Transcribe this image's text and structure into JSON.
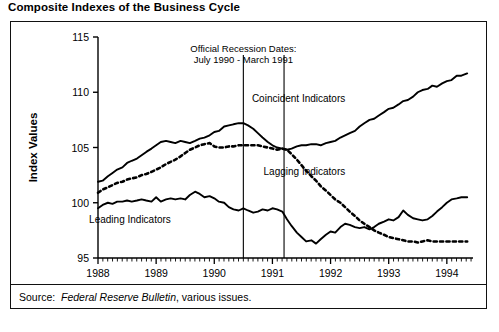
{
  "title": "Composite Indexes of the Business Cycle",
  "source": {
    "label": "Source:",
    "publication": "Federal Reserve Bulletin",
    "suffix": ", various issues."
  },
  "chart_data": {
    "type": "line",
    "title": "Composite Indexes of the Business Cycle",
    "xlabel": "Years",
    "ylabel": "Index Values",
    "xlim": [
      1988,
      1994.45
    ],
    "ylim": [
      95,
      115
    ],
    "yticks": [
      95,
      100,
      105,
      110,
      115
    ],
    "xticks": [
      1988,
      1989,
      1990,
      1991,
      1992,
      1993,
      1994
    ],
    "grid": false,
    "legend_position": "inline-annotations",
    "annotations": [
      {
        "name": "recession-dates",
        "line1": "Official Recession Dates:",
        "line2": "July 1990 - March 1991",
        "x": 1990.5,
        "y": 113.6
      }
    ],
    "vlines": [
      {
        "name": "recession-start",
        "x": 1990.5,
        "label": "July 1990"
      },
      {
        "name": "recession-end",
        "x": 1991.2,
        "label": "March 1991"
      }
    ],
    "series": [
      {
        "name": "Coincident Indicators",
        "style": "solid",
        "color": "#000000",
        "label_x": 1991.45,
        "label_y": 109.1,
        "x": [
          1988.0,
          1988.08,
          1988.17,
          1988.25,
          1988.33,
          1988.42,
          1988.5,
          1988.58,
          1988.67,
          1988.75,
          1988.83,
          1988.92,
          1989.0,
          1989.08,
          1989.17,
          1989.25,
          1989.33,
          1989.42,
          1989.5,
          1989.58,
          1989.67,
          1989.75,
          1989.83,
          1989.92,
          1990.0,
          1990.08,
          1990.17,
          1990.25,
          1990.33,
          1990.42,
          1990.5,
          1990.58,
          1990.67,
          1990.75,
          1990.83,
          1990.92,
          1991.0,
          1991.08,
          1991.17,
          1991.25,
          1991.33,
          1991.42,
          1991.5,
          1991.58,
          1991.67,
          1991.75,
          1991.83,
          1991.92,
          1992.0,
          1992.08,
          1992.17,
          1992.25,
          1992.33,
          1992.42,
          1992.5,
          1992.58,
          1992.67,
          1992.75,
          1992.83,
          1992.92,
          1993.0,
          1993.08,
          1993.17,
          1993.25,
          1993.33,
          1993.42,
          1993.5,
          1993.58,
          1993.67,
          1993.75,
          1993.83,
          1993.92,
          1994.0,
          1994.08,
          1994.17,
          1994.25,
          1994.35
        ],
        "values": [
          101.9,
          102.0,
          102.4,
          102.7,
          103.0,
          103.2,
          103.6,
          103.8,
          104.0,
          104.3,
          104.6,
          104.9,
          105.2,
          105.5,
          105.6,
          105.5,
          105.4,
          105.6,
          105.5,
          105.4,
          105.6,
          105.8,
          105.9,
          106.1,
          106.4,
          106.5,
          106.9,
          107.0,
          107.1,
          107.2,
          107.2,
          107.0,
          106.7,
          106.3,
          105.9,
          105.5,
          105.2,
          105.0,
          104.9,
          104.8,
          104.9,
          105.1,
          105.2,
          105.2,
          105.3,
          105.3,
          105.2,
          105.4,
          105.5,
          105.6,
          105.9,
          106.1,
          106.3,
          106.5,
          106.9,
          107.2,
          107.5,
          107.6,
          107.9,
          108.2,
          108.5,
          108.6,
          108.9,
          109.2,
          109.3,
          109.6,
          110.0,
          110.2,
          110.3,
          110.6,
          110.5,
          110.8,
          111.0,
          111.1,
          111.5,
          111.5,
          111.7
        ]
      },
      {
        "name": "Lagging Indicators",
        "style": "dashed",
        "color": "#000000",
        "label_x": 1991.55,
        "label_y": 102.5,
        "x": [
          1988.0,
          1988.08,
          1988.17,
          1988.25,
          1988.33,
          1988.42,
          1988.5,
          1988.58,
          1988.67,
          1988.75,
          1988.83,
          1988.92,
          1989.0,
          1989.08,
          1989.17,
          1989.25,
          1989.33,
          1989.42,
          1989.5,
          1989.58,
          1989.67,
          1989.75,
          1989.83,
          1989.92,
          1990.0,
          1990.08,
          1990.17,
          1990.25,
          1990.33,
          1990.42,
          1990.5,
          1990.58,
          1990.67,
          1990.75,
          1990.83,
          1990.92,
          1991.0,
          1991.08,
          1991.17,
          1991.25,
          1991.33,
          1991.42,
          1991.5,
          1991.58,
          1991.67,
          1991.75,
          1991.83,
          1991.92,
          1992.0,
          1992.08,
          1992.17,
          1992.25,
          1992.33,
          1992.42,
          1992.5,
          1992.58,
          1992.67,
          1992.75,
          1992.83,
          1992.92,
          1993.0,
          1993.08,
          1993.17,
          1993.25,
          1993.33,
          1993.42,
          1993.5,
          1993.58,
          1993.67,
          1993.75,
          1993.83,
          1993.92,
          1994.0,
          1994.08,
          1994.17,
          1994.25,
          1994.35
        ],
        "values": [
          100.9,
          101.2,
          101.4,
          101.6,
          101.8,
          101.9,
          102.1,
          102.2,
          102.3,
          102.5,
          102.6,
          102.8,
          103.0,
          103.2,
          103.5,
          103.7,
          103.9,
          104.2,
          104.5,
          104.8,
          105.0,
          105.2,
          105.3,
          105.4,
          105.1,
          105.0,
          105.0,
          105.1,
          105.1,
          105.2,
          105.2,
          105.2,
          105.2,
          105.2,
          105.1,
          105.0,
          104.9,
          104.8,
          104.9,
          104.8,
          104.4,
          103.9,
          103.4,
          102.9,
          102.4,
          102.0,
          101.5,
          101.1,
          100.7,
          100.3,
          100.0,
          99.6,
          99.2,
          98.8,
          98.4,
          98.1,
          97.8,
          97.5,
          97.3,
          97.1,
          96.9,
          96.8,
          96.7,
          96.6,
          96.5,
          96.5,
          96.4,
          96.5,
          96.6,
          96.5,
          96.5,
          96.5,
          96.5,
          96.5,
          96.5,
          96.5,
          96.5
        ]
      },
      {
        "name": "Leading Indicators",
        "style": "solid",
        "color": "#000000",
        "label_x": 1988.55,
        "label_y": 98.2,
        "x": [
          1988.0,
          1988.08,
          1988.17,
          1988.25,
          1988.33,
          1988.42,
          1988.5,
          1988.58,
          1988.67,
          1988.75,
          1988.83,
          1988.92,
          1989.0,
          1989.08,
          1989.17,
          1989.25,
          1989.33,
          1989.42,
          1989.5,
          1989.58,
          1989.67,
          1989.75,
          1989.83,
          1989.92,
          1990.0,
          1990.08,
          1990.17,
          1990.25,
          1990.33,
          1990.42,
          1990.5,
          1990.58,
          1990.67,
          1990.75,
          1990.83,
          1990.92,
          1991.0,
          1991.08,
          1991.17,
          1991.25,
          1991.33,
          1991.42,
          1991.5,
          1991.58,
          1991.67,
          1991.75,
          1991.83,
          1991.92,
          1992.0,
          1992.08,
          1992.17,
          1992.25,
          1992.33,
          1992.42,
          1992.5,
          1992.58,
          1992.67,
          1992.75,
          1992.83,
          1992.92,
          1993.0,
          1993.08,
          1993.17,
          1993.25,
          1993.33,
          1993.42,
          1993.5,
          1993.58,
          1993.67,
          1993.75,
          1993.83,
          1993.92,
          1994.0,
          1994.08,
          1994.17,
          1994.25,
          1994.35
        ],
        "values": [
          99.5,
          99.8,
          100.0,
          99.9,
          100.1,
          100.1,
          100.2,
          100.1,
          100.2,
          100.3,
          100.2,
          100.1,
          100.5,
          100.1,
          100.3,
          100.4,
          100.3,
          100.4,
          100.3,
          100.7,
          101.0,
          100.8,
          100.5,
          100.6,
          100.4,
          100.1,
          100.0,
          99.6,
          99.4,
          99.3,
          99.5,
          99.3,
          99.1,
          99.2,
          99.4,
          99.3,
          99.5,
          99.4,
          99.2,
          98.5,
          97.9,
          97.3,
          96.9,
          96.5,
          96.6,
          96.3,
          96.7,
          97.1,
          97.4,
          97.3,
          97.8,
          98.1,
          98.0,
          97.8,
          97.7,
          97.8,
          97.6,
          97.8,
          98.1,
          98.3,
          98.5,
          98.4,
          98.7,
          99.3,
          98.9,
          98.6,
          98.5,
          98.4,
          98.5,
          98.8,
          99.2,
          99.6,
          100.0,
          100.3,
          100.4,
          100.5,
          100.5
        ]
      }
    ]
  }
}
